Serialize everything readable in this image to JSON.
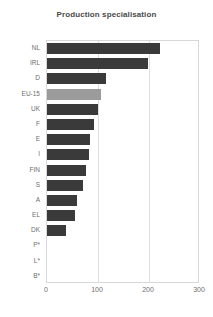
{
  "chart_data": {
    "type": "bar",
    "orientation": "horizontal",
    "title": "Production specialisation",
    "xlabel": "",
    "ylabel": "",
    "xlim": [
      0,
      300
    ],
    "xticks": [
      0,
      100,
      200,
      300
    ],
    "xtick_labels": [
      "0",
      "100",
      "200",
      "300"
    ],
    "grid": true,
    "grid_axis": "x",
    "legend": "none",
    "categories": [
      "NL",
      "IRL",
      "D",
      "EU-15",
      "UK",
      "F",
      "E",
      "I",
      "FIN",
      "S",
      "A",
      "EL",
      "DK",
      "P*",
      "L*",
      "B*"
    ],
    "values": [
      222,
      198,
      115,
      106,
      100,
      92,
      84,
      82,
      76,
      71,
      59,
      55,
      37,
      0,
      0,
      0
    ],
    "highlight_category": "EU-15",
    "colors": {
      "bar": "#3a3a3a",
      "bar_highlight": "#9b9b9b",
      "frame": "#d8d8d8",
      "gridline": "#dedede",
      "title_text": "#4a4a4a",
      "tick_text": "#6e6e6e",
      "background": "#ffffff"
    }
  }
}
